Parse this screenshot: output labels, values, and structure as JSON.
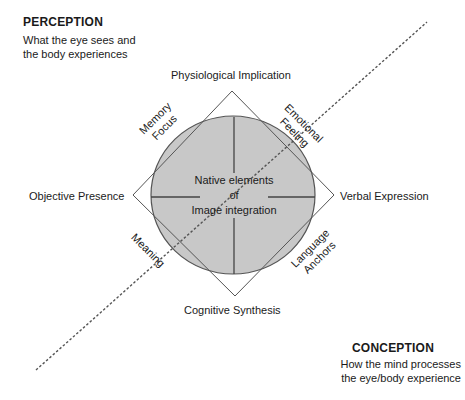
{
  "perception": {
    "title": "PERCEPTION",
    "line1": "What the eye sees and",
    "line2": "the body experiences"
  },
  "conception": {
    "title": "CONCEPTION",
    "line1": "How the mind processes",
    "line2": "the eye/body experience"
  },
  "axes": {
    "top": "Physiological Implication",
    "bottom": "Cognitive Synthesis",
    "left": "Objective Presence",
    "right": "Verbal Expression"
  },
  "diagonals": {
    "upper_left": {
      "line1": "Memory",
      "line2": "Focus"
    },
    "upper_right": {
      "line1": "Emotional",
      "line2": "Feeling"
    },
    "lower_left": {
      "line1": "Meaning"
    },
    "lower_right": {
      "line1": "Language",
      "line2": "Anchors"
    }
  },
  "center": {
    "line1": "Native elements",
    "line2": "of",
    "line3": "Image integration"
  },
  "colors": {
    "circle_fill": "#c8c8c8",
    "stroke": "#555555",
    "background": "#ffffff"
  }
}
